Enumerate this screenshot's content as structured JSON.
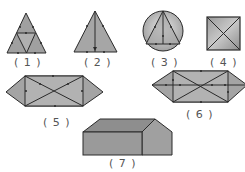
{
  "figure": {
    "colors": {
      "fill_light": "#b8b8b8",
      "fill_mid": "#a0a0a0",
      "fill_dark": "#8a8a8a",
      "edge": "#2a2a2a",
      "label": "#555555"
    },
    "shapes": [
      {
        "id": 1,
        "label": "( 1 )",
        "kind": "triangle subdivided into four triangles by midpoints"
      },
      {
        "id": 2,
        "label": "( 2 )",
        "kind": "triangle with median from apex to base"
      },
      {
        "id": 3,
        "label": "( 3 )",
        "kind": "triangle inscribed in circle with altitude"
      },
      {
        "id": 4,
        "label": "( 4 )",
        "kind": "square with both diagonals"
      },
      {
        "id": 5,
        "label": "( 5 )",
        "kind": "hexagon: rectangle with diagonals and triangular ends"
      },
      {
        "id": 6,
        "label": "( 6 )",
        "kind": "hexagon: rectangle with diagonals, midline and triangular ends"
      },
      {
        "id": 7,
        "label": "( 7 )",
        "kind": "pentagonal prism (house shape)"
      }
    ]
  }
}
